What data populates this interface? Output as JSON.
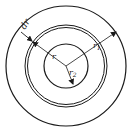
{
  "diagram": {
    "title": "",
    "labels": {
      "dr": "dr",
      "r": "r",
      "r1_base": "r",
      "r1_sub": "1",
      "r2_base": "r",
      "r2_sub": "2"
    },
    "colors": {
      "stroke": "#1a1a1a",
      "background": "#ffffff"
    }
  }
}
